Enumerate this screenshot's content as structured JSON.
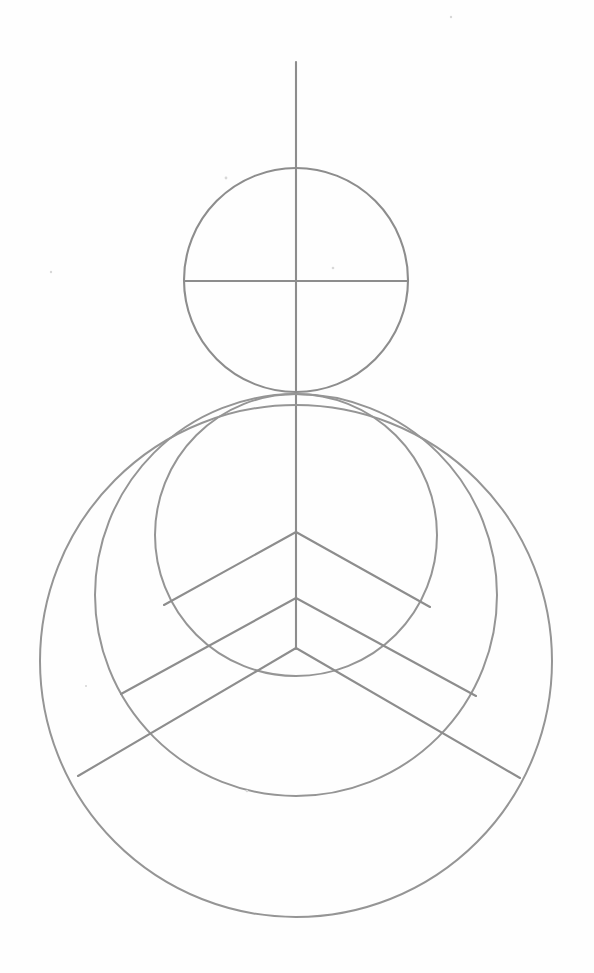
{
  "document": {
    "title": "Geometric Construction Diagram",
    "background_color": "#fefefe",
    "stroke_color": "#8d8d8d",
    "stroke_width": 2.1,
    "canvas": {
      "width": 594,
      "height": 973
    }
  },
  "figure": {
    "name": "nested-circles-and-chevrons",
    "axis": {
      "vertical_line": {
        "label": "vertical-axis",
        "x": 296,
        "y_top": 62,
        "y_bottom": 649
      },
      "horizontal_line": {
        "label": "horizontal-diameter",
        "y": 281,
        "x_left": 185,
        "x_right": 408
      }
    },
    "circles": [
      {
        "label": "head-circle",
        "cx": 296,
        "cy": 280,
        "r": 112
      },
      {
        "label": "inner-circle",
        "cx": 296,
        "cy": 535,
        "r": 141
      },
      {
        "label": "middle-circle",
        "cx": 296,
        "cy": 595,
        "r": 201
      },
      {
        "label": "outer-circle",
        "cx": 296,
        "cy": 661,
        "r": 256
      }
    ],
    "chevrons": [
      {
        "label": "chevron-upper",
        "apex_x": 296,
        "apex_y": 532,
        "left_end_x": 164,
        "left_end_y": 605,
        "right_end_x": 430,
        "right_end_y": 607
      },
      {
        "label": "chevron-middle",
        "apex_x": 296,
        "apex_y": 598,
        "left_end_x": 121,
        "left_end_y": 694,
        "right_end_x": 476,
        "right_end_y": 696
      },
      {
        "label": "chevron-lower",
        "apex_x": 296,
        "apex_y": 648,
        "left_end_x": 78,
        "left_end_y": 776,
        "right_end_x": 520,
        "right_end_y": 778
      }
    ],
    "specks": [
      {
        "cx": 226,
        "cy": 178,
        "r": 1.4
      },
      {
        "cx": 333,
        "cy": 268,
        "r": 1.3
      },
      {
        "cx": 51,
        "cy": 272,
        "r": 1.2
      },
      {
        "cx": 451,
        "cy": 17,
        "r": 1.2
      },
      {
        "cx": 247,
        "cy": 791,
        "r": 1.3
      },
      {
        "cx": 86,
        "cy": 686,
        "r": 1.1
      }
    ]
  }
}
